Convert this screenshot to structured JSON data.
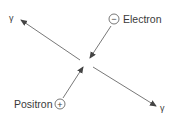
{
  "diagram": {
    "particles": {
      "electron": {
        "label": "Electron",
        "charge_symbol": "−"
      },
      "positron": {
        "label": "Positron",
        "charge_symbol": "+"
      }
    },
    "photons": [
      {
        "label": "γ",
        "direction": "top-left"
      },
      {
        "label": "γ",
        "direction": "bottom-right"
      }
    ],
    "colors": {
      "line": "#555555",
      "text": "#3a3a3a"
    }
  }
}
